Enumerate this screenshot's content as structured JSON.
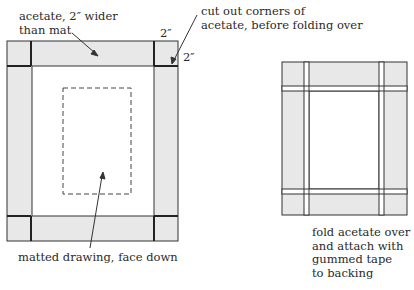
{
  "labels": {
    "acetate_wider": [
      "acetate, 2″ wider",
      "than mat"
    ],
    "cut_corners": [
      "cut out corners of",
      "acetate, before folding over"
    ],
    "dim_top": "2″",
    "dim_side": "2″",
    "matted_drawing": "matted drawing, face down",
    "fold_over": [
      "fold acetate over",
      "and attach with",
      "gummed tape",
      "to backing"
    ]
  },
  "colors": {
    "fill": "#e8e8e8",
    "line": "#333333",
    "background": "#ffffff"
  }
}
